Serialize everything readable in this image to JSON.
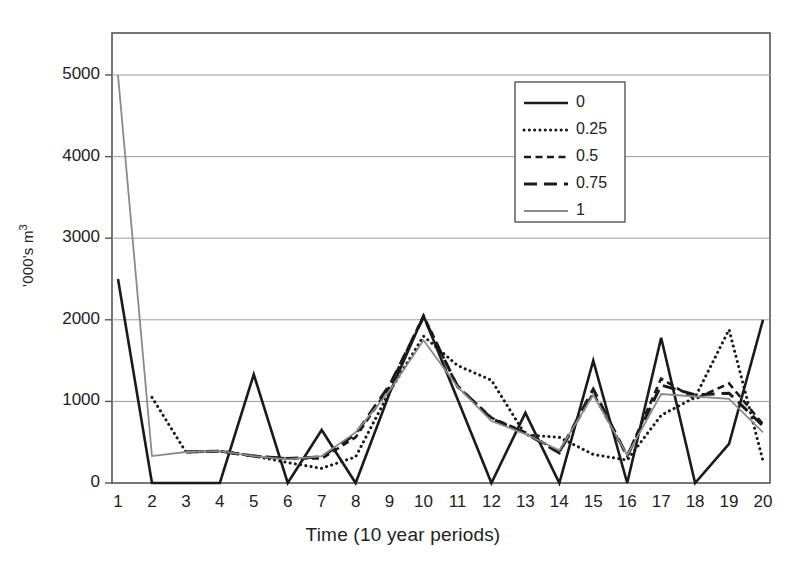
{
  "chart_data": {
    "type": "line",
    "title": "",
    "xlabel": "Time (10 year periods)",
    "ylabel": "'000's m3",
    "ylabel_display": "'000's m",
    "ylabel_superscript": "3",
    "xlim": [
      1,
      20
    ],
    "ylim": [
      0,
      5500
    ],
    "grid": true,
    "gridlines_y": [
      1000,
      2000,
      3000,
      4000,
      5000
    ],
    "legend_position": "upper-right",
    "x": [
      1,
      2,
      3,
      4,
      5,
      6,
      7,
      8,
      9,
      10,
      11,
      12,
      13,
      14,
      15,
      16,
      17,
      18,
      19,
      20
    ],
    "xticklabels": [
      "1",
      "2",
      "3",
      "4",
      "5",
      "6",
      "7",
      "8",
      "9",
      "10",
      "11",
      "12",
      "13",
      "14",
      "15",
      "16",
      "17",
      "18",
      "19",
      "20"
    ],
    "yticklabels": [
      "0",
      "1000",
      "2000",
      "3000",
      "4000",
      "5000"
    ],
    "yticks": [
      0,
      1000,
      2000,
      3000,
      4000,
      5000
    ],
    "series": [
      {
        "name": "0",
        "style": "solid",
        "color": "#1a1a1a",
        "width": 2.6,
        "values": [
          2500,
          0,
          0,
          0,
          1330,
          0,
          650,
          0,
          1100,
          2050,
          1030,
          0,
          860,
          0,
          1500,
          0,
          1780,
          0,
          480,
          2000
        ]
      },
      {
        "name": "0.25",
        "style": "dotted",
        "color": "#1a1a1a",
        "width": 3.0,
        "values": [
          null,
          1050,
          380,
          390,
          330,
          250,
          180,
          320,
          1120,
          1800,
          1440,
          1260,
          590,
          560,
          350,
          280,
          830,
          1050,
          1880,
          270
        ]
      },
      {
        "name": "0.5",
        "style": "dashed-short",
        "color": "#1a1a1a",
        "width": 2.6,
        "values": [
          null,
          null,
          380,
          390,
          330,
          300,
          300,
          560,
          1180,
          2050,
          1180,
          800,
          620,
          380,
          1100,
          330,
          1280,
          1030,
          1220,
          720
        ]
      },
      {
        "name": "0.75",
        "style": "dashed-long",
        "color": "#1a1a1a",
        "width": 3.0,
        "values": [
          null,
          null,
          380,
          390,
          330,
          300,
          320,
          600,
          1200,
          2030,
          1190,
          790,
          610,
          370,
          1150,
          330,
          1200,
          1080,
          1100,
          700
        ]
      },
      {
        "name": "1",
        "style": "solid-thin",
        "color": "#8a8a8a",
        "width": 1.8,
        "values": [
          5000,
          330,
          380,
          390,
          330,
          290,
          330,
          620,
          1130,
          1750,
          1180,
          760,
          600,
          400,
          1080,
          340,
          1090,
          1060,
          1030,
          620
        ]
      }
    ]
  },
  "legend": {
    "entries": [
      {
        "label": "0"
      },
      {
        "label": "0.25"
      },
      {
        "label": "0.5"
      },
      {
        "label": "0.75"
      },
      {
        "label": "1"
      }
    ]
  },
  "axes": {
    "x_title": "Time (10 year periods)",
    "y_title_main": "'000's m",
    "y_title_sup": "3"
  }
}
